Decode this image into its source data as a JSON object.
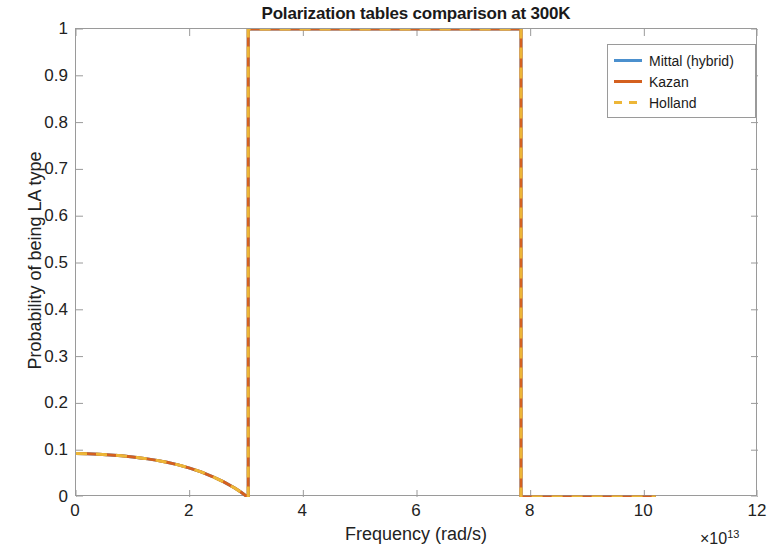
{
  "chart_data": {
    "type": "line",
    "title": "Polarization tables comparison at 300K",
    "xlabel": "Frequency (rad/s)",
    "ylabel": "Probability of being LA type",
    "x_exponent_prefix": "×",
    "x_exponent_base": "10",
    "x_exponent_power": "13",
    "xlim": [
      0,
      12
    ],
    "ylim": [
      0,
      1
    ],
    "xticks": [
      0,
      2,
      4,
      6,
      8,
      10,
      12
    ],
    "xtick_labels": [
      "0",
      "2",
      "4",
      "6",
      "8",
      "10",
      "12"
    ],
    "yticks": [
      0,
      0.1,
      0.2,
      0.3,
      0.4,
      0.5,
      0.6,
      0.7,
      0.8,
      0.9,
      1
    ],
    "ytick_labels": [
      "0",
      "0.1",
      "0.2",
      "0.3",
      "0.4",
      "0.5",
      "0.6",
      "0.7",
      "0.8",
      "0.9",
      "1"
    ],
    "grid": false,
    "legend_position": "top-right",
    "series": [
      {
        "name": "Mittal (hybrid)",
        "color": "#4B90CE",
        "linestyle": "solid",
        "linewidth": 3,
        "x": [
          0,
          0.2,
          0.4,
          0.6,
          0.8,
          1.0,
          1.2,
          1.4,
          1.6,
          1.8,
          2.0,
          2.2,
          2.4,
          2.6,
          2.8,
          2.9,
          3.0,
          3.03,
          3.03,
          7.83,
          7.83,
          10.2
        ],
        "values": [
          0.093,
          0.0925,
          0.0915,
          0.09,
          0.088,
          0.0855,
          0.0825,
          0.0788,
          0.0742,
          0.0686,
          0.0618,
          0.0536,
          0.0438,
          0.0322,
          0.0186,
          0.0105,
          0.0015,
          0.0,
          1.0,
          1.0,
          0.0,
          0.0
        ]
      },
      {
        "name": "Kazan",
        "color": "#D4601F",
        "linestyle": "solid",
        "linewidth": 3,
        "x": [
          0,
          0.2,
          0.4,
          0.6,
          0.8,
          1.0,
          1.2,
          1.4,
          1.6,
          1.8,
          2.0,
          2.2,
          2.4,
          2.6,
          2.8,
          2.9,
          3.0,
          3.03,
          3.03,
          7.83,
          7.83,
          10.2
        ],
        "values": [
          0.093,
          0.0925,
          0.0915,
          0.09,
          0.088,
          0.0855,
          0.0825,
          0.0788,
          0.0742,
          0.0686,
          0.0618,
          0.0536,
          0.0438,
          0.0322,
          0.0186,
          0.0105,
          0.0015,
          0.0,
          1.0,
          1.0,
          0.0,
          0.0
        ]
      },
      {
        "name": "Holland",
        "color": "#EDB637",
        "linestyle": "dashed",
        "linewidth": 3,
        "x": [
          0,
          0.2,
          0.4,
          0.6,
          0.8,
          1.0,
          1.2,
          1.4,
          1.6,
          1.8,
          2.0,
          2.2,
          2.4,
          2.6,
          2.8,
          2.9,
          3.0,
          3.03,
          3.03,
          7.83,
          7.83,
          10.2
        ],
        "values": [
          0.093,
          0.0925,
          0.0915,
          0.09,
          0.088,
          0.0855,
          0.0825,
          0.0788,
          0.0742,
          0.0686,
          0.0618,
          0.0536,
          0.0438,
          0.0322,
          0.0186,
          0.0105,
          0.0015,
          0.0,
          1.0,
          1.0,
          0.0,
          0.0
        ]
      }
    ],
    "annotations": [
      "All three polarization tables overlap; the Kazan (orange) and Holland (yellow dashed) curves are drawn last and obscure the Mittal (hybrid) blue curve.",
      "Probability decays from ~0.093 at 0 to 0 near 3e13 rad/s, steps to 1 between ~3.03e13 and ~7.83e13 rad/s, then drops to 0 until ~10.2e13 rad/s."
    ]
  },
  "legend": {
    "entries": [
      {
        "label": "Mittal (hybrid)",
        "color": "#4B90CE",
        "dashed": false
      },
      {
        "label": "Kazan",
        "color": "#D4601F",
        "dashed": false
      },
      {
        "label": "Holland",
        "color": "#EDB637",
        "dashed": true
      }
    ]
  }
}
